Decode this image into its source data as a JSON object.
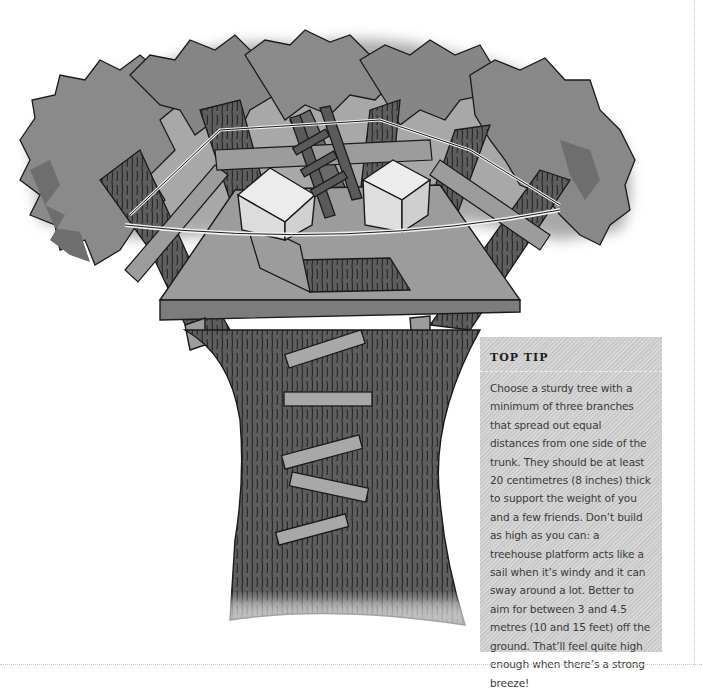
{
  "illustration": {
    "subject": "treehouse platform built between branching tree trunks",
    "elements": [
      "foliage",
      "tree-trunk",
      "platform",
      "rope-ladder",
      "storage-cubes",
      "trap-door",
      "rope-railing",
      "trunk-ladder-steps"
    ],
    "colors": {
      "foliage": "#8a8a8a",
      "foliage_shadow": "#6e6e6e",
      "bark": "#5e5e5e",
      "bark_lines": "#2a2a2a",
      "platform": "#9c9c9c",
      "cube": "#e2e2e2",
      "rope": "#f2f2f2",
      "steps": "#a8a8a8",
      "outline": "#1a1a1a"
    }
  },
  "tip": {
    "title": "TOP TIP",
    "body": "Choose a sturdy tree with a minimum of three branches that spread out equal distances from one side of the trunk. They should be at least 20 centimetres (8 inches) thick to support the weight of you and a few friends. Don’t build as high as you can: a treehouse platform acts like a sail when it’s windy and it can sway around a lot. Better to aim for between 3 and 4.5 metres (10 and 15 feet) off the ground. That’ll feel quite high enough when there’s a strong breeze!",
    "background": "#cfcfcf"
  }
}
